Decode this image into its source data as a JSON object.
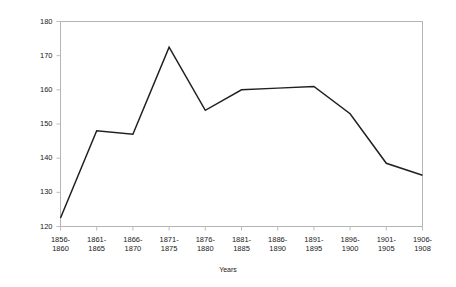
{
  "chart_data": {
    "type": "line",
    "title": "",
    "xlabel": "Years",
    "ylabel": "Rate/1,000",
    "categories": [
      "1856-1860",
      "1861-1865",
      "1866-1870",
      "1871-1875",
      "1876-1880",
      "1881-1885",
      "1886-1890",
      "1891-1895",
      "1896-1900",
      "1901-1905",
      "1906-1908"
    ],
    "category_lines": [
      [
        "1856-",
        "1860"
      ],
      [
        "1861-",
        "1865"
      ],
      [
        "1866-",
        "1870"
      ],
      [
        "1871-",
        "1875"
      ],
      [
        "1876-",
        "1880"
      ],
      [
        "1881-",
        "1885"
      ],
      [
        "1886-",
        "1890"
      ],
      [
        "1891-",
        "1895"
      ],
      [
        "1896-",
        "1900"
      ],
      [
        "1901-",
        "1905"
      ],
      [
        "1906-",
        "1908"
      ]
    ],
    "values": [
      122.5,
      148,
      147,
      172.5,
      154,
      160,
      160.5,
      161,
      153,
      138.5,
      135
    ],
    "ylim": [
      120,
      180
    ],
    "yticks": [
      120,
      130,
      140,
      150,
      160,
      170,
      180
    ],
    "ytick_labels": [
      "120",
      "130",
      "140",
      "150",
      "160",
      "170",
      "180"
    ],
    "grid": false,
    "legend": "none",
    "series_color": "#231f20",
    "axis_color": "#b5b5b5",
    "line_width": 1.5
  }
}
